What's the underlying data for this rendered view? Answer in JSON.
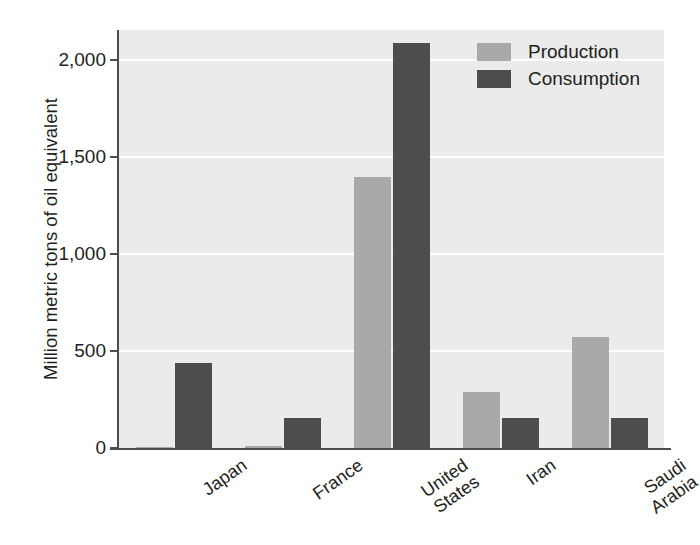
{
  "chart_data": {
    "type": "bar",
    "title": "",
    "xlabel": "",
    "ylabel": "Million metric tons of oil equivalent",
    "categories": [
      "Japan",
      "France",
      "United\nStates",
      "Iran",
      "Saudi\nArabia"
    ],
    "series": [
      {
        "name": "Production",
        "color": "#a9a9a9",
        "values": [
          5,
          10,
          1395,
          289,
          572
        ]
      },
      {
        "name": "Consumption",
        "color": "#4d4d4d",
        "values": [
          438,
          155,
          2090,
          155,
          155
        ]
      }
    ],
    "ylim": [
      0,
      2155
    ],
    "yticks": [
      0,
      500,
      1000,
      1500,
      2000
    ],
    "ytick_labels": [
      "0",
      "500",
      "1,000",
      "1,500",
      "2,000"
    ],
    "grid": true,
    "grid_color": "#ffffff",
    "legend_position": "top-right",
    "plot_background": "#ebebeb",
    "axis_color": "#4d4d4d",
    "bar_orientation": "vertical",
    "grouped": true
  },
  "legend": {
    "items": [
      {
        "label": "Production"
      },
      {
        "label": "Consumption"
      }
    ]
  }
}
